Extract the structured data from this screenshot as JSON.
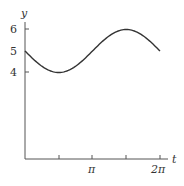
{
  "chart_data": {
    "type": "line",
    "title": "",
    "xlabel": "t",
    "ylabel": "y",
    "function": "y = 5 - sin(t)",
    "x_ticks": [
      {
        "value": 1.5708,
        "label": ""
      },
      {
        "value": 3.1416,
        "label": "π"
      },
      {
        "value": 4.7124,
        "label": ""
      },
      {
        "value": 6.2832,
        "label": "2π"
      }
    ],
    "y_ticks": [
      {
        "value": 4,
        "label": "4"
      },
      {
        "value": 5,
        "label": "5"
      },
      {
        "value": 6,
        "label": "6"
      }
    ],
    "xlim": [
      0,
      6.5
    ],
    "ylim": [
      0,
      6.5
    ],
    "grid": false,
    "legend": null,
    "series": [
      {
        "name": "y(t)",
        "color": "#333333",
        "x": [
          0,
          0.785,
          1.571,
          2.356,
          3.142,
          3.927,
          4.712,
          5.498,
          6.283
        ],
        "values": [
          5,
          4.29,
          4,
          4.29,
          5,
          5.71,
          6,
          5.71,
          5
        ]
      }
    ]
  },
  "axes": {
    "x_label": "t",
    "y_label": "y",
    "x_tick_labels": [
      "π",
      "2π"
    ],
    "y_tick_labels": [
      "6",
      "5",
      "4"
    ]
  }
}
